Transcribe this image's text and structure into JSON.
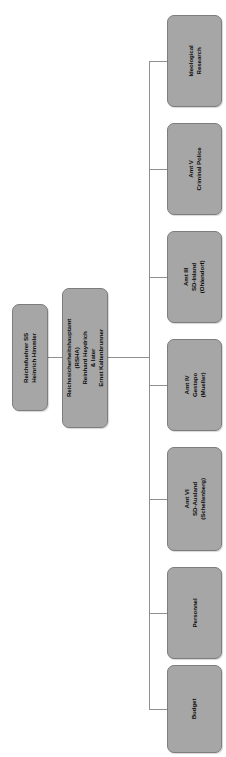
{
  "diagram": {
    "orientation": "rotated-90-ccw",
    "colors": {
      "node_fill": "#a6a6a6",
      "node_border": "#7d7d7d",
      "line": "#8f8f8f",
      "text": "#0c0c0c",
      "background": "#ffffff"
    },
    "root": {
      "name": "reichsfuehrer-ss",
      "line1": "Reichsfuehrer SS",
      "line2": "Heinrich Himmler"
    },
    "second_level": {
      "name": "rsha",
      "line1": "Reichssicherheitshauptamt",
      "line2": "(RSHA)",
      "line3": "Reinhard Heydrich",
      "line4": "& later",
      "line5": "Ernst Kaltenbrunner"
    },
    "children": [
      {
        "name": "ideological-research",
        "line1": "Ideological",
        "line2": "Research",
        "line3": "",
        "top": 15,
        "height": 92
      },
      {
        "name": "amt-v-criminal-police",
        "line1": "Amt V",
        "line2": "Criminal Police",
        "line3": "",
        "top": 123,
        "height": 92
      },
      {
        "name": "amt-iii-sd-inland",
        "line1": "Amt III",
        "line2": "SD-Inland",
        "line3": "(Ohlendorf)",
        "top": 231,
        "height": 92
      },
      {
        "name": "amt-iv-gestapo",
        "line1": "Amt IV",
        "line2": "Gestapo",
        "line3": "(Mueller)",
        "top": 339,
        "height": 92
      },
      {
        "name": "amt-vi-sd-ausland",
        "line1": "Amt VI",
        "line2": "SD-Ausland",
        "line3": "(Schellenberg)",
        "top": 447,
        "height": 104
      },
      {
        "name": "personnel",
        "line1": "Personnel",
        "line2": "",
        "line3": "",
        "top": 567,
        "height": 92
      },
      {
        "name": "budget",
        "line1": "Budget",
        "line2": "",
        "line3": "",
        "top": 665,
        "height": 88
      }
    ]
  }
}
